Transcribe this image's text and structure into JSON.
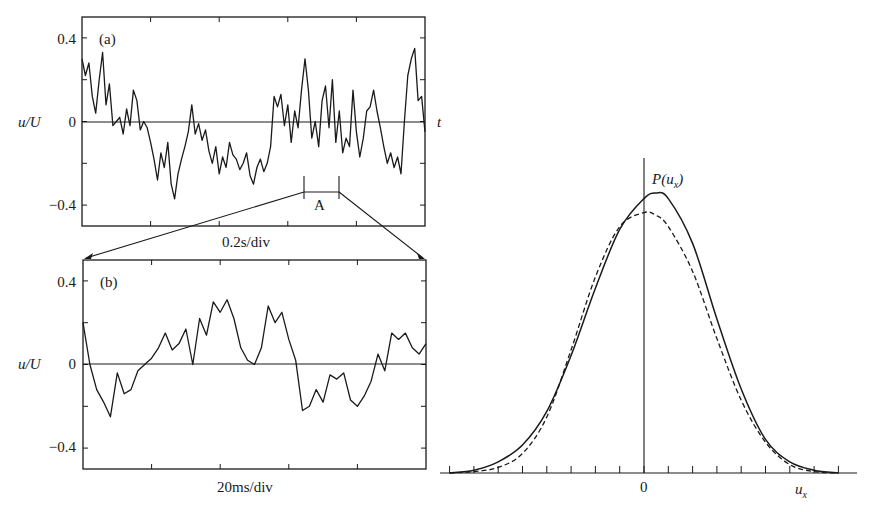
{
  "chart_data": [
    {
      "id": "a",
      "type": "line",
      "panel_label": "(a)",
      "title": "",
      "xlabel": "0.2s/div",
      "ylabel": "u/U",
      "axis_end_label": "t",
      "y_tick_labels": [
        "0.4",
        "0",
        "−0.4"
      ],
      "y_ticks": [
        0.4,
        0.2,
        0,
        -0.2,
        -0.4
      ],
      "ylim": [
        -0.5,
        0.5
      ],
      "x_divisions": 5,
      "zero_line": true,
      "grid": false,
      "annotation": {
        "label": "A",
        "x_range_fraction": [
          0.64,
          0.74
        ],
        "note": "segment enlarged in (b)"
      },
      "x": [
        0,
        0.01,
        0.02,
        0.03,
        0.04,
        0.05,
        0.06,
        0.07,
        0.08,
        0.09,
        0.1,
        0.11,
        0.12,
        0.13,
        0.14,
        0.15,
        0.16,
        0.17,
        0.18,
        0.19,
        0.2,
        0.21,
        0.22,
        0.23,
        0.24,
        0.25,
        0.26,
        0.27,
        0.28,
        0.29,
        0.3,
        0.31,
        0.32,
        0.33,
        0.34,
        0.35,
        0.36,
        0.37,
        0.38,
        0.39,
        0.4,
        0.41,
        0.42,
        0.43,
        0.44,
        0.45,
        0.46,
        0.47,
        0.48,
        0.49,
        0.5,
        0.51,
        0.52,
        0.53,
        0.54,
        0.55,
        0.56,
        0.57,
        0.58,
        0.59,
        0.6,
        0.61,
        0.62,
        0.63,
        0.64,
        0.65,
        0.66,
        0.67,
        0.68,
        0.69,
        0.7,
        0.71,
        0.72,
        0.73,
        0.74,
        0.75,
        0.76,
        0.77,
        0.78,
        0.79,
        0.8,
        0.81,
        0.82,
        0.83,
        0.84,
        0.85,
        0.86,
        0.87,
        0.88,
        0.89,
        0.9,
        0.91,
        0.92,
        0.93,
        0.94,
        0.95,
        0.96,
        0.97,
        0.98,
        0.99,
        1.0
      ],
      "values": [
        0.3,
        0.22,
        0.28,
        0.12,
        0.04,
        0.2,
        0.33,
        0.08,
        0.18,
        -0.02,
        0.0,
        0.02,
        -0.06,
        0.06,
        -0.02,
        0.15,
        0.1,
        -0.04,
        0.0,
        -0.03,
        -0.1,
        -0.18,
        -0.28,
        -0.15,
        -0.22,
        -0.1,
        -0.3,
        -0.37,
        -0.25,
        -0.18,
        -0.12,
        -0.05,
        0.08,
        -0.06,
        -0.01,
        -0.09,
        -0.04,
        -0.14,
        -0.2,
        -0.12,
        -0.25,
        -0.17,
        -0.22,
        -0.1,
        -0.16,
        -0.18,
        -0.23,
        -0.2,
        -0.15,
        -0.26,
        -0.3,
        -0.22,
        -0.18,
        -0.24,
        -0.2,
        -0.12,
        0.12,
        0.07,
        0.13,
        -0.02,
        0.08,
        -0.1,
        0.05,
        -0.03,
        0.15,
        0.3,
        0.15,
        -0.08,
        0.0,
        -0.12,
        0.1,
        0.17,
        -0.03,
        0.2,
        -0.1,
        0.05,
        -0.15,
        -0.08,
        -0.12,
        0.15,
        -0.05,
        -0.17,
        -0.08,
        0.05,
        0.07,
        0.15,
        0.05,
        -0.03,
        -0.12,
        -0.2,
        -0.15,
        -0.22,
        -0.17,
        -0.25,
        0.0,
        0.22,
        0.3,
        0.35,
        0.1,
        0.12,
        -0.05
      ]
    },
    {
      "id": "b",
      "type": "line",
      "panel_label": "(b)",
      "title": "",
      "xlabel": "20ms/div",
      "ylabel": "u/U",
      "y_tick_labels": [
        "0.4",
        "0",
        "−0.4"
      ],
      "y_ticks": [
        0.4,
        0.2,
        0,
        -0.2,
        -0.4
      ],
      "ylim": [
        -0.5,
        0.5
      ],
      "x_divisions": 5,
      "zero_line": true,
      "grid": false,
      "x": [
        0,
        0.02,
        0.04,
        0.06,
        0.08,
        0.1,
        0.12,
        0.14,
        0.16,
        0.18,
        0.2,
        0.22,
        0.24,
        0.26,
        0.28,
        0.3,
        0.32,
        0.34,
        0.36,
        0.38,
        0.4,
        0.42,
        0.44,
        0.46,
        0.48,
        0.5,
        0.52,
        0.54,
        0.56,
        0.58,
        0.6,
        0.62,
        0.64,
        0.66,
        0.68,
        0.7,
        0.72,
        0.74,
        0.76,
        0.78,
        0.8,
        0.82,
        0.84,
        0.86,
        0.88,
        0.9,
        0.92,
        0.94,
        0.96,
        0.98,
        1.0
      ],
      "values": [
        0.2,
        0.0,
        -0.12,
        -0.18,
        -0.25,
        -0.04,
        -0.14,
        -0.12,
        -0.03,
        0.0,
        0.03,
        0.08,
        0.15,
        0.07,
        0.1,
        0.17,
        0.0,
        0.22,
        0.14,
        0.3,
        0.25,
        0.31,
        0.22,
        0.08,
        0.02,
        0.0,
        0.08,
        0.28,
        0.2,
        0.25,
        0.12,
        0.02,
        -0.22,
        -0.2,
        -0.12,
        -0.18,
        -0.05,
        -0.07,
        -0.04,
        -0.17,
        -0.2,
        -0.15,
        -0.08,
        0.05,
        -0.03,
        0.15,
        0.12,
        0.15,
        0.08,
        0.05,
        0.1
      ]
    },
    {
      "id": "pdf",
      "type": "line",
      "title": "",
      "ylabel": "P(u_x)",
      "xlabel": "u_x",
      "x_tick_labels": [
        "0"
      ],
      "x_minor_ticks": 17,
      "grid": false,
      "series": [
        {
          "name": "measured",
          "style": "solid",
          "x": [
            -8,
            -7,
            -6,
            -5,
            -4,
            -3,
            -2,
            -1,
            0,
            0.5,
            1,
            2,
            3,
            4,
            5,
            6,
            7,
            8
          ],
          "values": [
            0.0,
            0.01,
            0.04,
            0.1,
            0.22,
            0.42,
            0.66,
            0.87,
            0.98,
            1.0,
            0.98,
            0.82,
            0.55,
            0.3,
            0.12,
            0.04,
            0.01,
            0.0
          ]
        },
        {
          "name": "gaussian",
          "style": "dashed",
          "x": [
            -8,
            -7,
            -6,
            -5,
            -4,
            -3,
            -2,
            -1,
            0,
            0.5,
            1,
            2,
            3,
            4,
            5,
            6,
            7,
            8
          ],
          "values": [
            0.0,
            0.005,
            0.02,
            0.07,
            0.2,
            0.44,
            0.7,
            0.88,
            0.93,
            0.92,
            0.88,
            0.72,
            0.48,
            0.26,
            0.11,
            0.03,
            0.005,
            0.0
          ]
        }
      ]
    }
  ],
  "labels": {
    "panel_a": "(a)",
    "panel_b": "(b)",
    "ylabel_a": "u/U",
    "ylabel_b": "u/U",
    "tick_pos": "0.4",
    "tick_zero": "0",
    "tick_neg": "−0.4",
    "t_axis": "t",
    "zoom_region": "A",
    "xlabel_a": "0.2s/div",
    "xlabel_b": "20ms/div",
    "pdf_ylabel": "P(u",
    "pdf_ylabel_sub": "x",
    "pdf_ylabel_close": ")",
    "pdf_zero": "0",
    "pdf_xlabel": "u",
    "pdf_xlabel_sub": "x"
  },
  "colors": {
    "ink": "#1a1a1a",
    "background": "#ffffff"
  }
}
